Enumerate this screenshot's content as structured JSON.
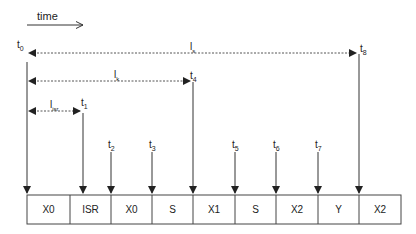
{
  "time_axis": {
    "label": "time"
  },
  "markers": [
    {
      "id": "t0",
      "base": "t",
      "sub": "0",
      "x": 27
    },
    {
      "id": "t1",
      "base": "t",
      "sub": "1",
      "x": 83
    },
    {
      "id": "t2",
      "base": "t",
      "sub": "2",
      "x": 111
    },
    {
      "id": "t3",
      "base": "t",
      "sub": "3",
      "x": 152
    },
    {
      "id": "t4",
      "base": "t",
      "sub": "4",
      "x": 193
    },
    {
      "id": "t5",
      "base": "t",
      "sub": "5",
      "x": 235
    },
    {
      "id": "t6",
      "base": "t",
      "sub": "6",
      "x": 276
    },
    {
      "id": "t7",
      "base": "t",
      "sub": "7",
      "x": 318
    },
    {
      "id": "t8",
      "base": "t",
      "sub": "8",
      "x": 359
    }
  ],
  "spans": [
    {
      "id": "ls",
      "base": "l",
      "sub": "s",
      "from": "t0",
      "to": "t8"
    },
    {
      "id": "lk",
      "base": "l",
      "sub": "k",
      "from": "t0",
      "to": "t4"
    },
    {
      "id": "lisr",
      "base": "l",
      "sub": "isr",
      "from": "t0",
      "to": "t1"
    }
  ],
  "segments": [
    {
      "label": "X0"
    },
    {
      "label": "ISR"
    },
    {
      "label": "X0"
    },
    {
      "label": "S"
    },
    {
      "label": "X1"
    },
    {
      "label": "S"
    },
    {
      "label": "X2"
    },
    {
      "label": "Y"
    },
    {
      "label": "X2"
    }
  ],
  "colors": {
    "line": "#333333",
    "dashed": "#555555",
    "text": "#222222"
  }
}
